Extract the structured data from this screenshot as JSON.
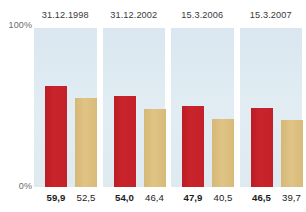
{
  "chart_data": {
    "type": "bar",
    "title": "",
    "xlabel": "",
    "ylabel": "",
    "ylim": [
      0,
      100
    ],
    "grid": false,
    "legend_position": "none",
    "categories": [
      "31.12.1998",
      "31.12.2002",
      "15.3.2006",
      "15.3.2007"
    ],
    "series": [
      {
        "name": "red",
        "color": "#C3212A",
        "values": [
          59.9,
          54.0,
          47.9,
          46.5
        ],
        "value_labels": [
          "59,9",
          "54,0",
          "47,9",
          "46,5"
        ]
      },
      {
        "name": "tan",
        "color": "#DCBE7E",
        "values": [
          52.5,
          46.4,
          40.5,
          39.7
        ],
        "value_labels": [
          "52,5",
          "46,4",
          "40,5",
          "39,7"
        ]
      }
    ],
    "axis": {
      "top_label": "100%",
      "bottom_label": "0%"
    }
  },
  "colors": {
    "red": "#C3212A",
    "tan": "#DCBE7E",
    "panel_background": "#DFEAF1",
    "page_background": "#FFFFFF",
    "axis_text": "#6B6B6B",
    "title_text": "#3A3A3A",
    "value_text": "#1C1C1C"
  },
  "panels": [
    {
      "title": "31.12.1998",
      "red_label": "59,9",
      "tan_label": "52,5",
      "red_value": 59.9,
      "tan_value": 52.5
    },
    {
      "title": "31.12.2002",
      "red_label": "54,0",
      "tan_label": "46,4",
      "red_value": 54.0,
      "tan_value": 46.4
    },
    {
      "title": "15.3.2006",
      "red_label": "47,9",
      "tan_label": "40,5",
      "red_value": 47.9,
      "tan_value": 40.5
    },
    {
      "title": "15.3.2007",
      "red_label": "46,5",
      "tan_label": "39,7",
      "red_value": 46.5,
      "tan_value": 39.7
    }
  ],
  "axis": {
    "top_label": "100%",
    "bottom_label": "0%"
  }
}
